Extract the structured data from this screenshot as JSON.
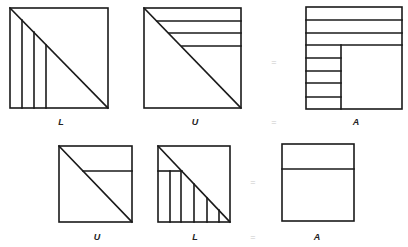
{
  "figure": {
    "stroke_color": "#1a1a1a",
    "equals_color": "#c8c8c8",
    "row1": {
      "labels": {
        "first": "L",
        "second": "U",
        "result": "A"
      },
      "equals_mid": "=",
      "equals_label": "="
    },
    "row2": {
      "labels": {
        "first": "U",
        "second": "L",
        "result": "A"
      },
      "equals_mid": "=",
      "equals_label": "="
    }
  }
}
